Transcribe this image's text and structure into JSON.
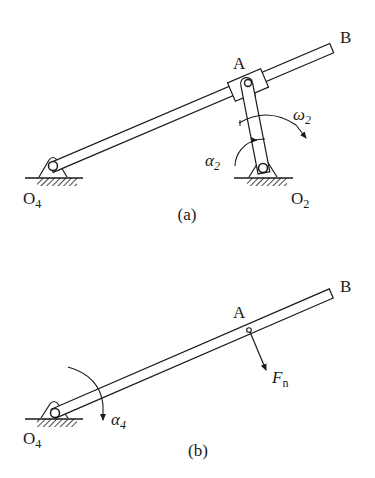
{
  "figure_a": {
    "caption": "(a)",
    "labels": {
      "point_A": "A",
      "point_B": "B",
      "pivot_O4": "O",
      "pivot_O4_sub": "4",
      "pivot_O2": "O",
      "pivot_O2_sub": "2",
      "omega": "ω",
      "omega_sub": "2",
      "alpha": "α",
      "alpha_sub": "2"
    }
  },
  "figure_b": {
    "caption": "(b)",
    "labels": {
      "point_A": "A",
      "point_B": "B",
      "pivot_O4": "O",
      "pivot_O4_sub": "4",
      "force": "F",
      "force_sub": "n",
      "alpha": "α",
      "alpha_sub": "4"
    }
  },
  "colors": {
    "stroke": "#1a1a1a",
    "background": "#ffffff"
  }
}
